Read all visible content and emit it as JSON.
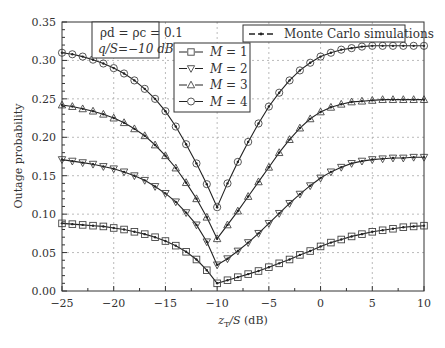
{
  "chart_data": {
    "type": "line",
    "title": "",
    "xlabel": "z_T/S (dB)",
    "ylabel": "Outage probability",
    "xlim": [
      -25,
      10
    ],
    "ylim": [
      0,
      0.35
    ],
    "xticks": [
      -25,
      -20,
      -15,
      -10,
      -5,
      0,
      5,
      10
    ],
    "xtick_labels": [
      "−25",
      "−20",
      "−15",
      "−10",
      "−5",
      "0",
      "5",
      "10"
    ],
    "yticks": [
      0,
      0.05,
      0.1,
      0.15,
      0.2,
      0.25,
      0.3,
      0.35
    ],
    "ytick_labels": [
      "0.00",
      "0.05",
      "0.10",
      "0.15",
      "0.20",
      "0.25",
      "0.30",
      "0.35"
    ],
    "grid": true,
    "annotation": {
      "line1": "ρd = ρc = 0.1",
      "line2": "q/S=−10 dB"
    },
    "legend_simulation": "Monte Carlo simulations",
    "x": [
      -25,
      -24,
      -23,
      -22,
      -21,
      -20,
      -19,
      -18,
      -17,
      -16,
      -15,
      -14,
      -13,
      -12,
      -11,
      -10,
      -9,
      -8,
      -7,
      -6,
      -5,
      -4,
      -3,
      -2,
      -1,
      0,
      1,
      2,
      3,
      4,
      5,
      6,
      7,
      8,
      9,
      10
    ],
    "series": [
      {
        "name": "M = 1",
        "marker": "square",
        "values": [
          0.088,
          0.087,
          0.086,
          0.085,
          0.084,
          0.082,
          0.08,
          0.077,
          0.074,
          0.07,
          0.065,
          0.059,
          0.051,
          0.041,
          0.027,
          0.01,
          0.014,
          0.018,
          0.022,
          0.026,
          0.031,
          0.036,
          0.041,
          0.047,
          0.052,
          0.058,
          0.063,
          0.067,
          0.071,
          0.074,
          0.077,
          0.079,
          0.081,
          0.083,
          0.084,
          0.085
        ]
      },
      {
        "name": "M = 2",
        "marker": "triangle-down",
        "values": [
          0.171,
          0.169,
          0.167,
          0.165,
          0.162,
          0.159,
          0.155,
          0.15,
          0.144,
          0.136,
          0.127,
          0.116,
          0.102,
          0.086,
          0.064,
          0.034,
          0.042,
          0.052,
          0.063,
          0.075,
          0.088,
          0.101,
          0.114,
          0.126,
          0.137,
          0.147,
          0.155,
          0.161,
          0.166,
          0.169,
          0.171,
          0.172,
          0.173,
          0.173,
          0.174,
          0.174
        ]
      },
      {
        "name": "M = 3",
        "marker": "triangle-up",
        "values": [
          0.242,
          0.24,
          0.237,
          0.234,
          0.23,
          0.225,
          0.219,
          0.211,
          0.202,
          0.19,
          0.176,
          0.16,
          0.141,
          0.12,
          0.096,
          0.068,
          0.086,
          0.104,
          0.123,
          0.142,
          0.161,
          0.18,
          0.197,
          0.212,
          0.224,
          0.233,
          0.239,
          0.243,
          0.246,
          0.247,
          0.248,
          0.249,
          0.249,
          0.249,
          0.249,
          0.249
        ]
      },
      {
        "name": "M = 4",
        "marker": "circle",
        "values": [
          0.31,
          0.308,
          0.305,
          0.301,
          0.296,
          0.29,
          0.283,
          0.274,
          0.263,
          0.25,
          0.234,
          0.214,
          0.191,
          0.166,
          0.139,
          0.109,
          0.14,
          0.168,
          0.194,
          0.218,
          0.24,
          0.258,
          0.274,
          0.287,
          0.297,
          0.305,
          0.31,
          0.314,
          0.316,
          0.318,
          0.319,
          0.319,
          0.319,
          0.319,
          0.319,
          0.319
        ]
      }
    ],
    "legend_position": "upper center"
  }
}
